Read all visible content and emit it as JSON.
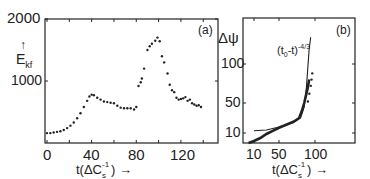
{
  "chart_data": [
    {
      "panel": "(a)",
      "type": "scatter",
      "xlabel": "t(ΔC_s^-1) →",
      "ylabel": "E_kf ↑",
      "xlim": [
        -2,
        153
      ],
      "ylim": [
        0,
        2000
      ],
      "xticks": [
        0,
        40,
        80,
        120
      ],
      "yticks": [
        1000,
        2000
      ],
      "grid": false,
      "series": [
        {
          "name": "E_kf",
          "marker": "dot",
          "x": [
            0,
            3,
            6,
            9,
            12,
            15,
            18,
            21,
            24,
            27,
            30,
            33,
            36,
            38,
            40,
            42,
            45,
            48,
            51,
            54,
            57,
            60,
            63,
            66,
            69,
            72,
            75,
            78,
            80,
            82,
            84,
            85,
            87,
            90,
            92,
            94,
            97,
            99,
            101,
            103,
            105,
            108,
            110,
            112,
            114,
            116,
            118,
            120,
            122,
            124,
            126,
            128,
            130,
            132,
            134,
            136,
            138
          ],
          "y": [
            160,
            160,
            170,
            180,
            190,
            210,
            240,
            280,
            330,
            400,
            480,
            580,
            680,
            750,
            780,
            770,
            730,
            700,
            670,
            660,
            650,
            640,
            600,
            570,
            560,
            560,
            560,
            540,
            580,
            920,
            980,
            1040,
            1200,
            1500,
            1560,
            1600,
            1650,
            1700,
            1640,
            1400,
            1300,
            1120,
            940,
            850,
            820,
            730,
            700,
            710,
            720,
            740,
            680,
            700,
            640,
            620,
            600,
            610,
            580
          ]
        }
      ]
    },
    {
      "panel": "(b)",
      "type": "line",
      "xlabel": "t(ΔC_s^-1) →",
      "ylabel": "Δψ",
      "xticks": [
        10,
        50,
        100
      ],
      "yticks": [
        10,
        50,
        100
      ],
      "grid": false,
      "annotation": "(t_0 - t)^-4/3",
      "series": [
        {
          "name": "(t_0 - t)^-4/3 fit",
          "style": "thin line",
          "x": [
            10,
            30,
            50,
            60,
            70,
            80,
            85,
            88,
            90,
            92,
            94
          ],
          "y": [
            13,
            14,
            18,
            21,
            24,
            30,
            45,
            70,
            95,
            120,
            135
          ]
        },
        {
          "name": "data",
          "style": "thick line + dots",
          "x": [
            5,
            10,
            20,
            30,
            40,
            50,
            60,
            70,
            78,
            82,
            85,
            88,
            90,
            92
          ],
          "y": [
            0,
            2,
            5,
            9,
            13,
            17,
            21,
            25,
            30,
            40,
            50,
            62,
            70,
            80
          ]
        }
      ]
    }
  ],
  "panel_a": {
    "tag": "(a)",
    "y_label_main": "E",
    "y_label_sub": "kf",
    "y_arrow": "↑",
    "y_ticks": [
      "2000",
      "1000"
    ],
    "x_ticks": [
      "0",
      "40",
      "80",
      "120"
    ],
    "x_label": "t(ΔC",
    "x_label_sub": "s",
    "x_label_sup": "-1",
    "x_label_end": ") →"
  },
  "panel_b": {
    "tag": "(b)",
    "y_label": "Δψ",
    "y_ticks": [
      "100",
      "50",
      "10"
    ],
    "x_ticks": [
      "10",
      "50",
      "100"
    ],
    "x_label": "t(ΔC",
    "x_label_sub": "s",
    "x_label_sup": "-1",
    "x_label_end": ") →",
    "annotation_base": "(t",
    "annotation_sub": "0",
    "annotation_mid": "-t)",
    "annotation_sup": "-4/3"
  }
}
